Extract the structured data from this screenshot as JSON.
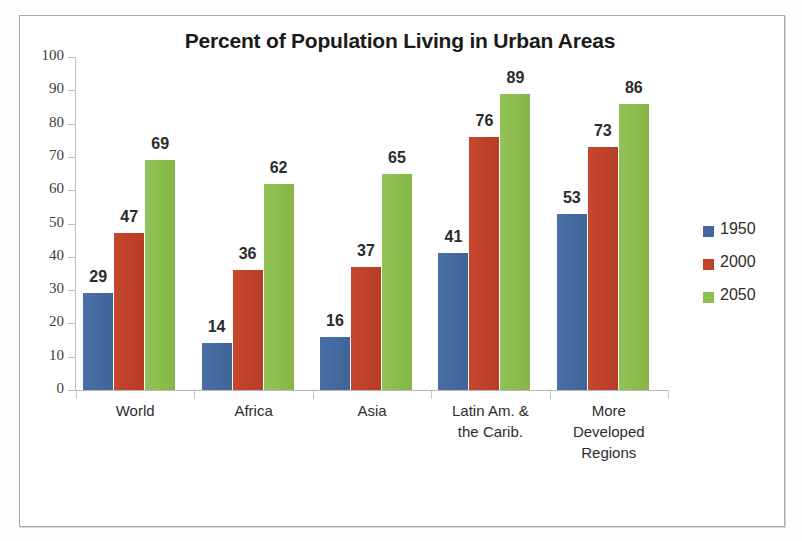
{
  "chart_data": {
    "type": "bar",
    "title": "Percent of Population Living in Urban Areas",
    "xlabel": "",
    "ylabel": "",
    "ylim": [
      0,
      100
    ],
    "yticks": [
      0,
      10,
      20,
      30,
      40,
      50,
      60,
      70,
      80,
      90,
      100
    ],
    "grid": false,
    "legend_position": "right",
    "data_labels": true,
    "categories": [
      "World",
      "Africa",
      "Asia",
      "Latin Am. &\nthe Carib.",
      "More\nDeveloped\nRegions"
    ],
    "series": [
      {
        "name": "1950",
        "color": "#44689e",
        "values": [
          29,
          14,
          16,
          41,
          53
        ]
      },
      {
        "name": "2000",
        "color": "#c0402b",
        "values": [
          47,
          36,
          37,
          76,
          73
        ]
      },
      {
        "name": "2050",
        "color": "#8ebe4f",
        "values": [
          69,
          62,
          65,
          89,
          86
        ]
      }
    ]
  },
  "axis": {
    "y_tick_labels": [
      "100",
      "90",
      "80",
      "70",
      "60",
      "50",
      "40",
      "30",
      "20",
      "10",
      "0"
    ]
  },
  "categories_lines": [
    [
      "World"
    ],
    [
      "Africa"
    ],
    [
      "Asia"
    ],
    [
      "Latin Am. &",
      "the Carib."
    ],
    [
      "More",
      "Developed",
      "Regions"
    ]
  ],
  "legend": {
    "items": [
      {
        "label": "1950",
        "color": "#44689e"
      },
      {
        "label": "2000",
        "color": "#c0402b"
      },
      {
        "label": "2050",
        "color": "#8ebe4f"
      }
    ]
  }
}
